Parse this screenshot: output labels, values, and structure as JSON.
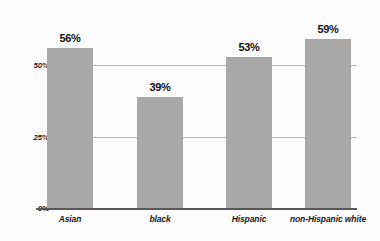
{
  "chart_data": {
    "type": "bar",
    "title": "",
    "xlabel": "",
    "ylabel": "",
    "categories": [
      "Asian",
      "black",
      "Hispanic",
      "non-Hispanic white"
    ],
    "values": [
      56,
      39,
      53,
      59
    ],
    "value_labels": [
      "56%",
      "39%",
      "53%",
      "59%"
    ],
    "ylim": [
      0,
      70
    ],
    "yticks": [
      0,
      25,
      50
    ],
    "ytick_labels": [
      "0%",
      "25%",
      "50%"
    ],
    "grid": "horizontal",
    "legend": "none",
    "series": [
      {
        "name": "",
        "values": [
          56,
          39,
          53,
          59
        ]
      }
    ]
  },
  "style": {
    "bar_color": "#a9a9a9",
    "gridline_color": "#b5b5b5",
    "axis_color": "#585858",
    "text_color": "#1a1a1a",
    "background": "#fdfdfd"
  }
}
